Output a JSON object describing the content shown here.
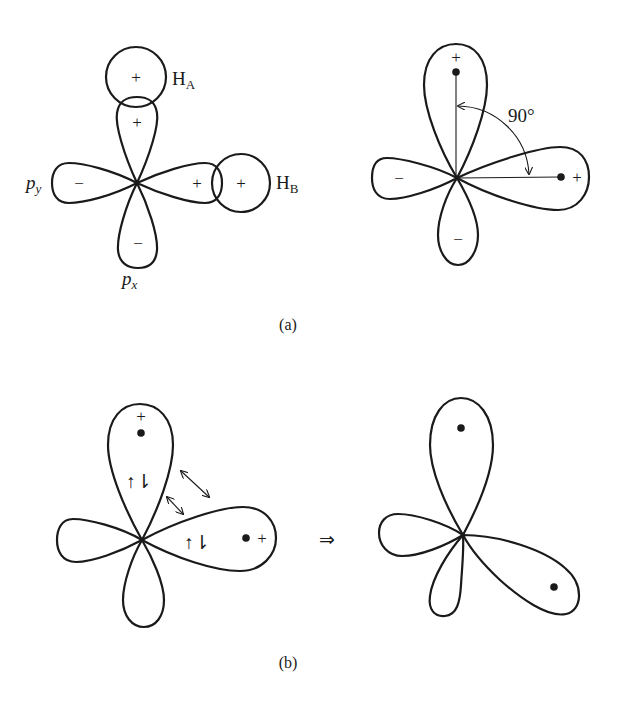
{
  "figure": {
    "panel_a": {
      "caption": "(a)",
      "left": {
        "labels": {
          "ha": "H",
          "ha_sub": "A",
          "hb": "H",
          "hb_sub": "B",
          "py": "p",
          "py_sub": "y",
          "px": "p",
          "px_sub": "x"
        },
        "signs": {
          "ha_circle": "+",
          "hb_circle": "+",
          "lobe_up": "+",
          "lobe_right": "+",
          "lobe_left": "−",
          "lobe_down": "−"
        }
      },
      "right": {
        "angle_label": "90°",
        "signs": {
          "lobe_up": "+",
          "lobe_right": "+",
          "lobe_left": "−",
          "lobe_down": "−"
        }
      }
    },
    "panel_b": {
      "caption": "(b)",
      "left": {
        "signs": {
          "lobe_up": "+",
          "lobe_right": "+"
        },
        "electron_pairs": {
          "lobe_up": "↑⇂",
          "lobe_right": "↑⇂"
        }
      },
      "transition_arrow": "⇒",
      "right": {}
    }
  }
}
